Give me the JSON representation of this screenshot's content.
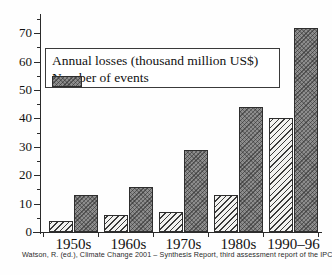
{
  "chart_data": {
    "type": "bar",
    "title": "",
    "subtitle": "",
    "xlabel": "",
    "ylabel": "",
    "categories": [
      "1950s",
      "1960s",
      "1970s",
      "1980s",
      "1990–96"
    ],
    "series": [
      {
        "name": "Annual losses (thousand million US$)",
        "key": "losses",
        "pattern": "diagonal-hatch",
        "color": "#f2f2f0",
        "values": [
          4,
          6,
          7,
          13,
          40
        ]
      },
      {
        "name": "Number of events",
        "key": "events",
        "pattern": "solid-gray-crosshatch",
        "color": "#8d8d8d",
        "values": [
          13,
          16,
          29,
          44,
          72
        ]
      }
    ],
    "ylim": [
      0,
      75
    ],
    "yticks": [
      0,
      10,
      20,
      30,
      40,
      50,
      60,
      70
    ],
    "ytick_labels": [
      "0",
      "10",
      "20",
      "30",
      "40",
      "50",
      "60",
      "70"
    ],
    "yminor_ticks": [
      5,
      15,
      25,
      35,
      45,
      55,
      65,
      75
    ],
    "grid": false,
    "legend_position": "upper-left-inside"
  },
  "legend": {
    "entries": [
      {
        "label": "Annual losses (thousand million US$)",
        "swatch": "hatched-swatch"
      },
      {
        "label": "Number of events",
        "swatch": "gray-swatch"
      }
    ]
  },
  "caption": {
    "text": "Watson, R. (ed.), Climate Change 2001 – Synthesis Report, third assessment report of the IPCC, © IPCC"
  },
  "colors": {
    "axis": "#2b2b2b",
    "losses_fill": "#f2f2f0",
    "events_fill": "#8d8d8d",
    "background": "#fefefe",
    "text": "#111111"
  }
}
